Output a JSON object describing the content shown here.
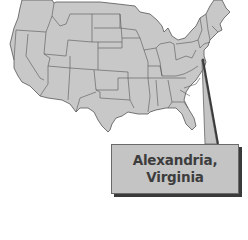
{
  "map": {
    "title": "United States",
    "fill_color": "#c8c8c8",
    "border_color": "#555555",
    "marker_location": "Alexandria, Virginia"
  },
  "callout": {
    "line1": "Alexandria,",
    "line2": "Virginia",
    "fill_color": "#c4c4c4",
    "text_color": "#3d3d3d",
    "shadow_color": "#3a3a3a"
  }
}
